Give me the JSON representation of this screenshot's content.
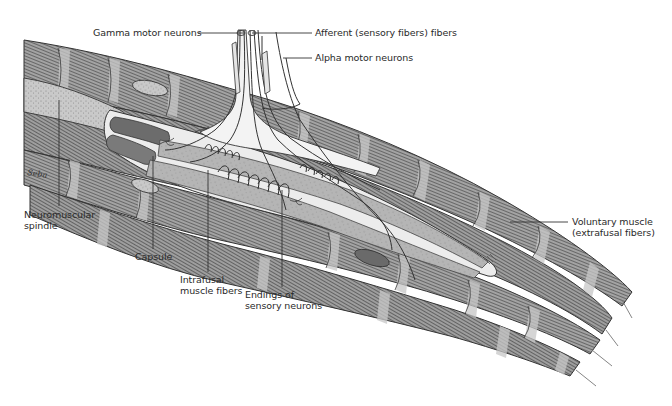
{
  "figure": {
    "colors": {
      "background": "#ffffff",
      "muscle_fill": "#9a9a9a",
      "muscle_band_light": "#c4c4c4",
      "striation": "#4a4a4a",
      "outline": "#333333",
      "capsule_fill": "#e6e6e6",
      "spindle_sheath": "#bdbdbd",
      "intrafusal_fill": "#b3b3b3",
      "nerve_fill": "#f2f2f2",
      "nerve_stroke": "#3a3a3a",
      "label_text": "#2a2a2a",
      "leader_line": "#333333"
    }
  },
  "labels": {
    "gamma": "Gamma motor neurons",
    "afferent": "Afferent (sensory fibers) fibers",
    "alpha": "Alpha motor neurons",
    "spindle": {
      "line1": "Neuromuscular",
      "line2": "spindle"
    },
    "capsule": "Capsule",
    "intrafusal": {
      "line1": "Intrafusal",
      "line2": "muscle fibers"
    },
    "endings": {
      "line1": "Endings of",
      "line2": "sensory neurons"
    },
    "voluntary": {
      "line1": "Voluntary muscle",
      "line2": "(extrafusal fibers)"
    }
  },
  "signature": "artist-signature"
}
